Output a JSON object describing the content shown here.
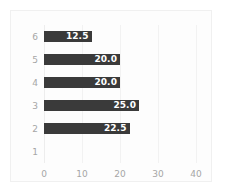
{
  "chart_data": {
    "type": "bar",
    "orientation": "horizontal",
    "title": "",
    "subtitle": "",
    "xlabel": "",
    "ylabel": "",
    "categories": [
      "6",
      "5",
      "4",
      "3",
      "2",
      "1"
    ],
    "values": [
      12.5,
      20.0,
      20.0,
      25.0,
      22.5,
      0
    ],
    "data_labels": [
      "12.5",
      "20.0",
      "20.0",
      "25.0",
      "22.5",
      ""
    ],
    "series": [
      {
        "name": "",
        "values": [
          12.5,
          20.0,
          20.0,
          25.0,
          22.5,
          0
        ]
      }
    ],
    "xlim": [
      0,
      45
    ],
    "xticks": [
      0,
      10,
      20,
      30,
      40
    ],
    "xticklabels": [
      "0",
      "10",
      "20",
      "30",
      "40"
    ],
    "yticklabels": [
      "6",
      "5",
      "4",
      "3",
      "2",
      "1"
    ],
    "grid": true,
    "grid_axis": "x",
    "legend": false,
    "legend_position": "none",
    "bar_color": "#3a3a3a",
    "data_label_color": "#ffffff",
    "tick_label_color": "#a6a6a6",
    "gridline_color": "#f2f2f2",
    "panel_border_color": "#f0f0f0",
    "background_color": "#ffffff"
  }
}
